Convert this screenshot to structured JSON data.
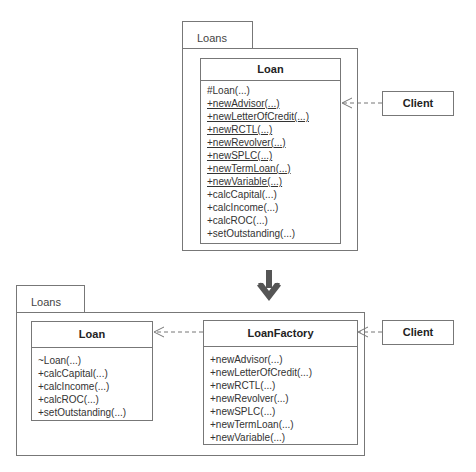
{
  "before": {
    "package": {
      "label": "Loans"
    },
    "loan_class": {
      "name": "Loan",
      "operations": [
        {
          "text": "#Loan(...)",
          "static": false
        },
        {
          "text": "+newAdvisor(...)",
          "static": true
        },
        {
          "text": "+newLetterOfCredit(...)",
          "static": true
        },
        {
          "text": "+newRCTL(...)",
          "static": true
        },
        {
          "text": "+newRevolver(...)",
          "static": true
        },
        {
          "text": "+newSPLC(...)",
          "static": true
        },
        {
          "text": "+newTermLoan(...)",
          "static": true
        },
        {
          "text": "+newVariable(...)",
          "static": true
        },
        {
          "text": "+calcCapital(...)",
          "static": false
        },
        {
          "text": "+calcIncome(...)",
          "static": false
        },
        {
          "text": "+calcROC(...)",
          "static": false
        },
        {
          "text": "+setOutstanding(...)",
          "static": false
        }
      ]
    },
    "client": {
      "name": "Client"
    }
  },
  "transition": {
    "icon": "down-arrow-icon"
  },
  "after": {
    "package": {
      "label": "Loans"
    },
    "loan_class": {
      "name": "Loan",
      "operations": [
        "~Loan(...)",
        "+calcCapital(...)",
        "+calcIncome(...)",
        "+calcROC(...)",
        "+setOutstanding(...)"
      ]
    },
    "factory_class": {
      "name": "LoanFactory",
      "operations": [
        "+newAdvisor(...)",
        "+newLetterOfCredit(...)",
        "+newRCTL(...)",
        "+newRevolver(...)",
        "+newSPLC(...)",
        "+newTermLoan(...)",
        "+newVariable(...)"
      ]
    },
    "client": {
      "name": "Client"
    }
  },
  "colors": {
    "line": "#777777",
    "arrow": "#555555"
  }
}
